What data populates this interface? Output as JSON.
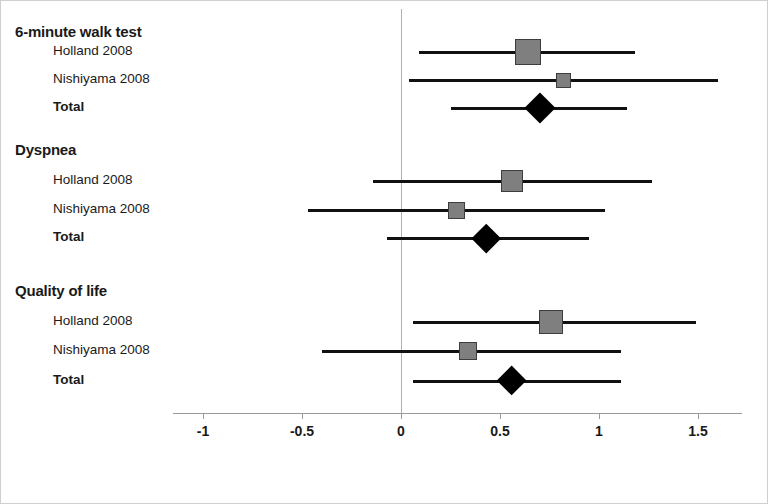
{
  "chart_data": {
    "type": "forest",
    "title": "",
    "xlabel": "",
    "ylabel": "",
    "xlim": [
      -1.15,
      1.72
    ],
    "grid": false,
    "legend": "none",
    "null_line": 0,
    "xticks": [
      "-1",
      "-0.5",
      "0",
      "0.5",
      "1",
      "1.5"
    ],
    "xtick_values": [
      -1,
      -0.5,
      0,
      0.5,
      1,
      1.5
    ],
    "groups": [
      {
        "heading": "6-minute walk test",
        "rows": [
          {
            "label": "Holland 2008",
            "type": "study",
            "estimate": 0.64,
            "ci_lower": 0.09,
            "ci_upper": 1.18,
            "marker": "square",
            "marker_size": 26
          },
          {
            "label": "Nishiyama 2008",
            "type": "study",
            "estimate": 0.82,
            "ci_lower": 0.04,
            "ci_upper": 1.6,
            "marker": "square",
            "marker_size": 15
          },
          {
            "label": "Total",
            "type": "summary",
            "estimate": 0.7,
            "ci_lower": 0.25,
            "ci_upper": 1.14,
            "marker": "diamond",
            "marker_size": 31
          }
        ]
      },
      {
        "heading": "Dyspnea",
        "rows": [
          {
            "label": "Holland 2008",
            "type": "study",
            "estimate": 0.56,
            "ci_lower": -0.14,
            "ci_upper": 1.27,
            "marker": "square",
            "marker_size": 22
          },
          {
            "label": "Nishiyama 2008",
            "type": "study",
            "estimate": 0.28,
            "ci_lower": -0.47,
            "ci_upper": 1.03,
            "marker": "square",
            "marker_size": 17
          },
          {
            "label": "Total",
            "type": "summary",
            "estimate": 0.43,
            "ci_lower": -0.07,
            "ci_upper": 0.95,
            "marker": "diamond",
            "marker_size": 29
          }
        ]
      },
      {
        "heading": "Quality of life",
        "rows": [
          {
            "label": "Holland 2008",
            "type": "study",
            "estimate": 0.76,
            "ci_lower": 0.06,
            "ci_upper": 1.49,
            "marker": "square",
            "marker_size": 24
          },
          {
            "label": "Nishiyama 2008",
            "type": "study",
            "estimate": 0.34,
            "ci_lower": -0.4,
            "ci_upper": 1.11,
            "marker": "square",
            "marker_size": 18
          },
          {
            "label": "Total",
            "type": "summary",
            "estimate": 0.56,
            "ci_lower": 0.06,
            "ci_upper": 1.11,
            "marker": "diamond",
            "marker_size": 30
          }
        ]
      }
    ]
  },
  "colors": {
    "marker_fill": "#7f7f7f",
    "marker_edge": "#3d3d3d",
    "summary_fill": "#000000",
    "line": "#111111",
    "axis": "#9a9a9a",
    "zero_line": "#b0b0b0",
    "text": "#1a1a1a",
    "frame": "#cfcfcf"
  },
  "layout": {
    "x_zero_px": 400,
    "px_per_unit": 198,
    "heading_y": [
      22,
      140,
      281
    ],
    "row_y": [
      42,
      70,
      98,
      171,
      200,
      228,
      312,
      341,
      371
    ],
    "axis_y": 412
  }
}
